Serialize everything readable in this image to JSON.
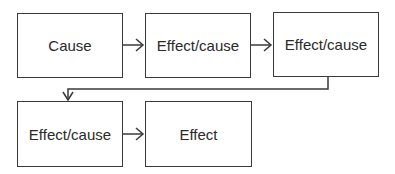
{
  "diagram": {
    "type": "flowchart",
    "nodes": [
      {
        "id": "n1",
        "label": "Cause"
      },
      {
        "id": "n2",
        "label": "Effect/cause"
      },
      {
        "id": "n3",
        "label": "Effect/cause"
      },
      {
        "id": "n4",
        "label": "Effect/cause"
      },
      {
        "id": "n5",
        "label": "Effect"
      }
    ],
    "edges": [
      {
        "from": "n1",
        "to": "n2"
      },
      {
        "from": "n2",
        "to": "n3"
      },
      {
        "from": "n3",
        "to": "n4"
      },
      {
        "from": "n4",
        "to": "n5"
      }
    ],
    "colors": {
      "stroke": "#3a3a3a",
      "text": "#2a2a2a",
      "background": "#ffffff"
    }
  }
}
